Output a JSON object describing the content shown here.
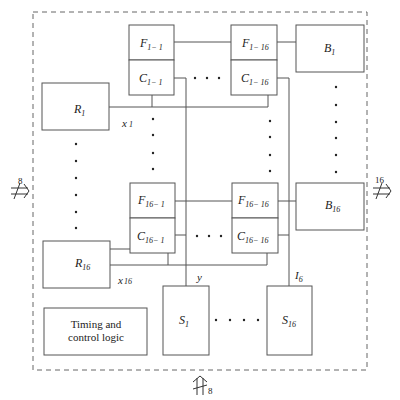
{
  "diagram": {
    "type": "block-diagram",
    "frame": {
      "style": "dashed"
    },
    "flip_flops": [
      {
        "id": "F1-1",
        "letter": "F",
        "sub": "1− 1"
      },
      {
        "id": "F1-16",
        "letter": "F",
        "sub": "1− 16"
      },
      {
        "id": "F16-1",
        "letter": "F",
        "sub": "16− 1"
      },
      {
        "id": "F16-16",
        "letter": "F",
        "sub": "16− 16"
      }
    ],
    "comparators": [
      {
        "id": "C1-1",
        "letter": "C",
        "sub": "1− 1"
      },
      {
        "id": "C1-16",
        "letter": "C",
        "sub": "1− 16"
      },
      {
        "id": "C16-1",
        "letter": "C",
        "sub": "16− 1"
      },
      {
        "id": "C16-16",
        "letter": "C",
        "sub": "16− 16"
      }
    ],
    "registers": [
      {
        "id": "R1",
        "letter": "R",
        "sub": "1"
      },
      {
        "id": "R16",
        "letter": "R",
        "sub": "16"
      }
    ],
    "buffers": [
      {
        "id": "B1",
        "letter": "B",
        "sub": "1"
      },
      {
        "id": "B16",
        "letter": "B",
        "sub": "16"
      }
    ],
    "selectors": [
      {
        "id": "S1",
        "letter": "S",
        "sub": "1"
      },
      {
        "id": "S16",
        "letter": "S",
        "sub": "16"
      }
    ],
    "signals": {
      "x1": {
        "letter": "x",
        "sub": "1"
      },
      "x16": {
        "letter": "x",
        "sub": "16"
      },
      "y": {
        "letter": "y"
      },
      "I6": {
        "letter": "I",
        "sub": "6"
      }
    },
    "timing_block": {
      "line1": "Timing and",
      "line2": "control logic"
    },
    "bus_inputs": {
      "left": {
        "width": "8",
        "direction": "in"
      },
      "right": {
        "width": "16",
        "direction": "out"
      },
      "bottom": {
        "width": "8",
        "direction": "in"
      }
    },
    "ellipsis": "· · ·"
  }
}
